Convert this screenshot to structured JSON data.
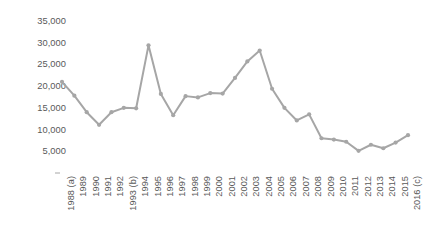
{
  "chart_data": {
    "type": "line",
    "title": "",
    "subtitle": "",
    "xlabel": "",
    "ylabel": "",
    "categories": [
      "1988 (a)",
      "1989",
      "1990",
      "1991",
      "1992",
      "1993 (b)",
      "1994",
      "1995",
      "1996",
      "1997",
      "1998",
      "1999",
      "2000",
      "2001",
      "2002",
      "2003",
      "2004",
      "2005",
      "2006",
      "2007",
      "2008",
      "2009",
      "2010",
      "2011",
      "2012",
      "2013",
      "2014",
      "2015",
      "2016 (c)"
    ],
    "values": [
      21000,
      17800,
      14000,
      11100,
      14000,
      15000,
      14900,
      29400,
      18200,
      13300,
      17700,
      17400,
      18400,
      18300,
      21900,
      25700,
      28200,
      19400,
      15000,
      12100,
      13500,
      8000,
      7700,
      7200,
      5100,
      6500,
      5700,
      7000,
      8700
    ],
    "series": [
      {
        "name": "",
        "values": [
          21000,
          17800,
          14000,
          11100,
          14000,
          15000,
          14900,
          29400,
          18200,
          13300,
          17700,
          17400,
          18400,
          18300,
          21900,
          25700,
          28200,
          19400,
          15000,
          12100,
          13500,
          8000,
          7700,
          7200,
          5100,
          6500,
          5700,
          7000,
          8700
        ],
        "color": "#a6a6a6"
      }
    ],
    "ylim": [
      0,
      35000
    ],
    "ytick_labels": [
      "35,000",
      "30,000",
      "25,000",
      "20,000",
      "15,000",
      "10,000",
      "5,000"
    ],
    "ytick_values": [
      35000,
      30000,
      25000,
      20000,
      15000,
      10000,
      5000
    ],
    "grid": false,
    "legend": false,
    "legend_position": "none",
    "markers": true,
    "marker_shape": "circle",
    "line_color": "#a6a6a6",
    "marker_color": "#a6a6a6",
    "axis_color": "#a6a6a6",
    "text_color": "#595959",
    "background_color": "#ffffff"
  }
}
